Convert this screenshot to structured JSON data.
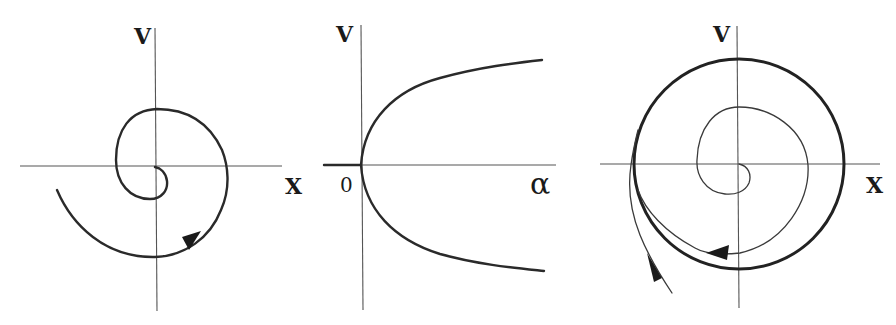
{
  "figure": {
    "panels": [
      {
        "id": "stable-focus",
        "description": "Phase portrait: trajectory spiraling into a stable focus at the origin",
        "x_label": "X",
        "y_label": "V"
      },
      {
        "id": "bifurcation",
        "description": "Hopf bifurcation diagram: limit-cycle amplitude grows as square root of alpha for alpha > 0",
        "x_label": "α",
        "y_label": "V",
        "origin_label": "0"
      },
      {
        "id": "limit-cycle",
        "description": "Phase portrait: stable limit cycle attracting trajectories from inside (spiraling out) and outside (spiraling in)",
        "x_label": "X",
        "y_label": "V"
      }
    ]
  }
}
